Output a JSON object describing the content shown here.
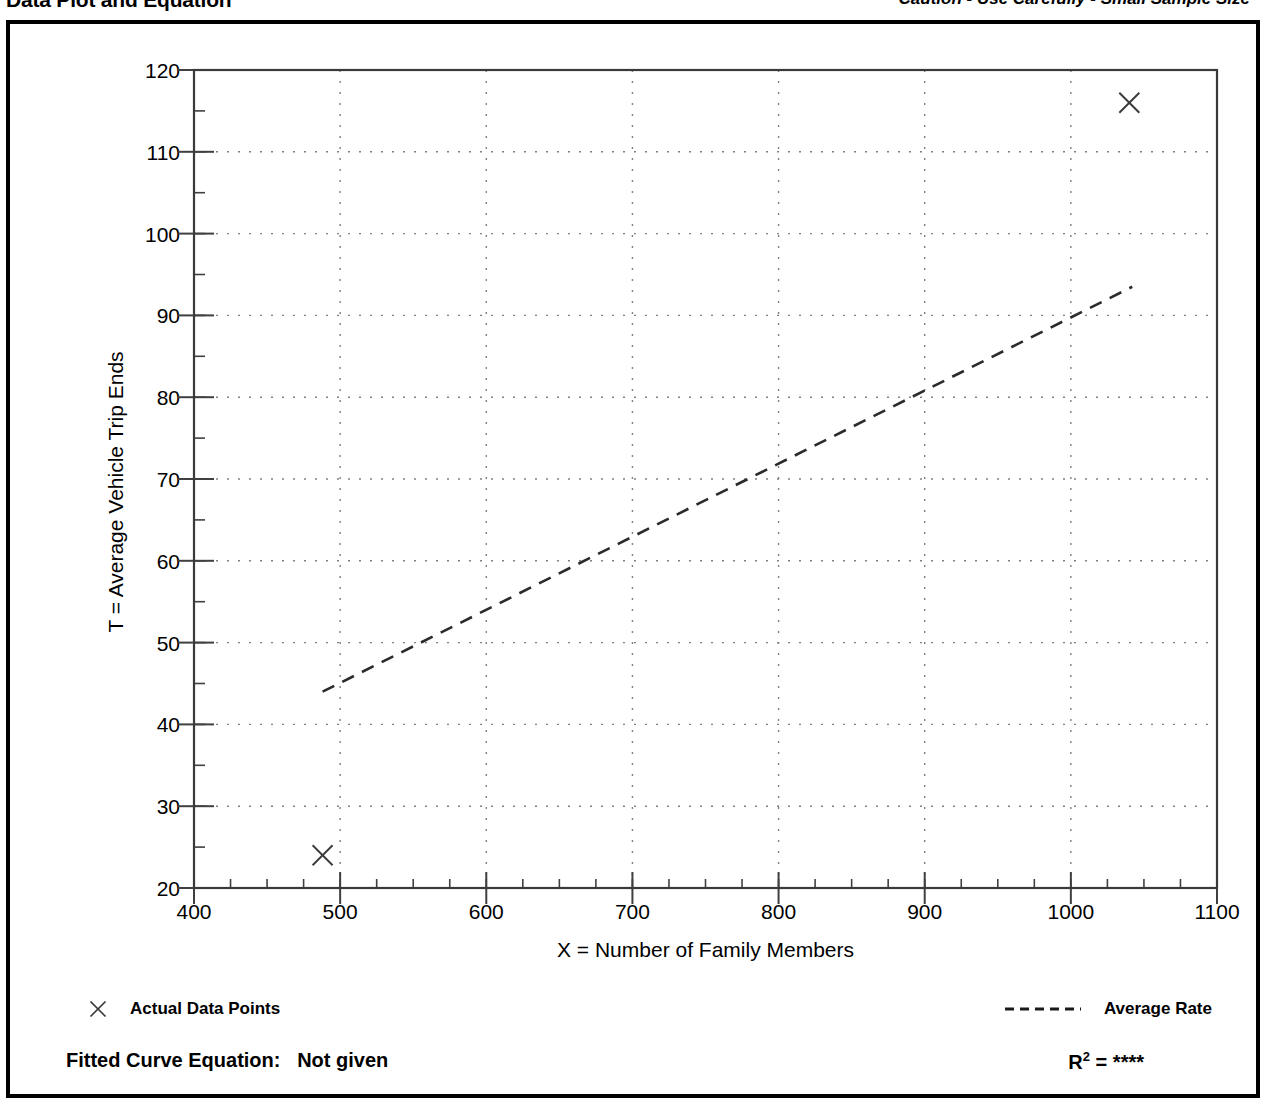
{
  "header": {
    "title": "Data Plot and Equation",
    "caution": "Caution - Use Carefully - Small Sample Size"
  },
  "chart_data": {
    "type": "scatter",
    "title": "Data Plot and Equation",
    "xlabel": "X = Number of Family Members",
    "ylabel": "T = Average Vehicle Trip Ends",
    "xlim": [
      400,
      1100
    ],
    "ylim": [
      20,
      120
    ],
    "xticks": [
      400,
      500,
      600,
      700,
      800,
      900,
      1000,
      1100
    ],
    "yticks": [
      20,
      30,
      40,
      50,
      60,
      70,
      80,
      90,
      100,
      110,
      120
    ],
    "x_minor_tick_step": 25,
    "y_minor_tick_step": 5,
    "grid": true,
    "grid_style": "dotted",
    "legend_position": "below-plot",
    "series": [
      {
        "name": "Actual Data Points",
        "type": "scatter",
        "marker": "x",
        "points": [
          {
            "x": 488,
            "y": 24
          },
          {
            "x": 1040,
            "y": 116
          }
        ]
      },
      {
        "name": "Average Rate",
        "type": "line",
        "style": "dashed",
        "points": [
          {
            "x": 488,
            "y": 44
          },
          {
            "x": 1042,
            "y": 93.5
          }
        ]
      }
    ],
    "annotations": {
      "fitted_curve_equation_label": "Fitted Curve Equation:",
      "fitted_curve_equation_value": "Not given",
      "r_squared_label": "R",
      "r_squared_exponent": "2",
      "r_squared_equals": "=",
      "r_squared_value": "****"
    }
  },
  "legend": {
    "data_points_label": "Actual Data Points",
    "average_rate_label": "Average Rate",
    "data_points_marker": "cross-marker-icon",
    "average_rate_marker": "dashed-line-icon"
  },
  "footer": {
    "equation": "Fitted Curve Equation:  Not given",
    "r2_text": "R2 = ****"
  },
  "colors": {
    "ink": "#000000",
    "grid": "#808080",
    "axis": "#404040",
    "background": "#ffffff"
  }
}
